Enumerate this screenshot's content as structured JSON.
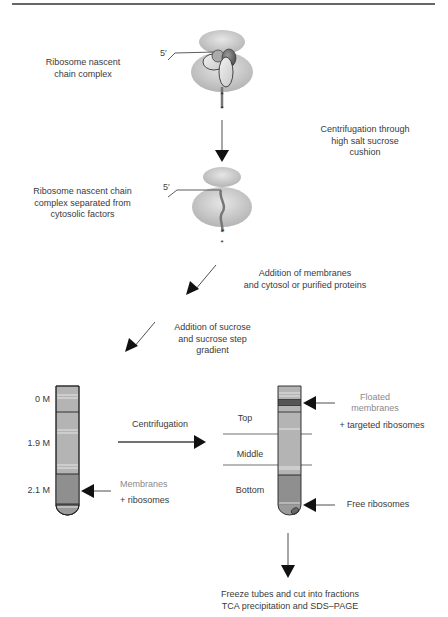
{
  "diagram": {
    "type": "flowchart",
    "colors": {
      "ribosome_fill": "#c8c8c8",
      "tube_fill": "#b4b4b4",
      "tube_dark": "#8e8e8e",
      "band_dark": "#555555",
      "line": "#222222",
      "grey_text": "#8a8a8a"
    },
    "steps": [
      {
        "id": "rnc",
        "label_lines": [
          "Ribosome nascent",
          "chain complex"
        ],
        "five_prime": "5′"
      },
      {
        "id": "step1",
        "label_lines": [
          "Centrifugation through",
          "high salt sucrose",
          "cushion"
        ]
      },
      {
        "id": "rnc_separated",
        "label_lines": [
          "Ribosome nascent chain",
          "complex separated from",
          "cytosolic factors"
        ],
        "five_prime": "5′"
      },
      {
        "id": "step2",
        "label_lines": [
          "Addition of membranes",
          "and cytosol or purified proteins"
        ]
      },
      {
        "id": "step3",
        "label_lines": [
          "Addition of sucrose",
          "and sucrose step",
          "gradient"
        ]
      },
      {
        "id": "step4",
        "label": "Centrifugation"
      },
      {
        "id": "step5",
        "label_lines": [
          "Freeze tubes and cut into fractions",
          "TCA precipitation and SDS–PAGE"
        ]
      }
    ],
    "tube_before": {
      "concentrations": [
        "0 M",
        "1.9 M",
        "2.1 M"
      ],
      "annotation": {
        "line1": "Membranes",
        "line2": "+ ribosomes"
      }
    },
    "tube_after": {
      "fractions": [
        "Top",
        "Middle",
        "Bottom"
      ],
      "annotations": {
        "floated_line1": "Floated",
        "floated_line2": "membranes",
        "floated_line3": "+ targeted ribosomes",
        "free": "Free ribosomes"
      }
    }
  }
}
